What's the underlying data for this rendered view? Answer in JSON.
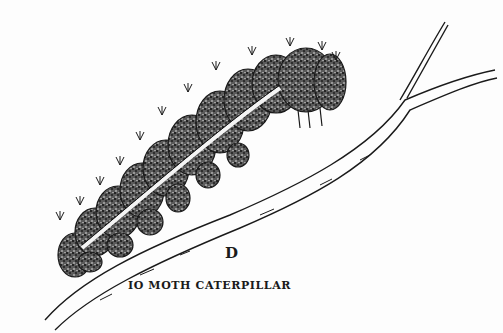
{
  "figure": {
    "letter": "D",
    "caption": "IO MOTH CATERPILLAR",
    "colors": {
      "background": "#fdfdfd",
      "ink": "#1a1a1a",
      "stipple": "#2b2b2b"
    }
  }
}
